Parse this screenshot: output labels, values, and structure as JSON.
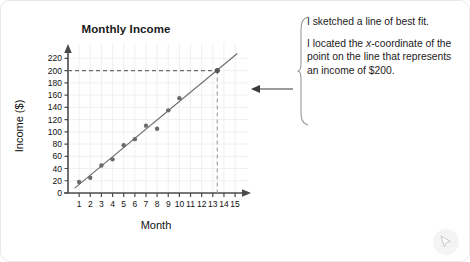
{
  "card": {
    "background": "#ffffff",
    "border_color": "#e8e8e8"
  },
  "chart_data": {
    "type": "scatter",
    "title": "Monthly Income",
    "xlabel": "Month",
    "ylabel": "Income ($)",
    "xlim": [
      0,
      15.8
    ],
    "ylim": [
      0,
      232
    ],
    "grid": true,
    "x_ticks": [
      1,
      2,
      3,
      4,
      5,
      6,
      7,
      8,
      9,
      10,
      11,
      12,
      13,
      14,
      15
    ],
    "y_ticks": [
      0,
      20,
      40,
      60,
      80,
      100,
      120,
      140,
      160,
      180,
      200,
      220
    ],
    "x_tick_labels": [
      "1",
      "2",
      "3",
      "4",
      "5",
      "6",
      "7",
      "8",
      "9",
      "10",
      "11",
      "12",
      "13",
      "14",
      "15"
    ],
    "y_tick_labels": [
      "0",
      "20",
      "40",
      "60",
      "80",
      "100",
      "120",
      "140",
      "160",
      "180",
      "200",
      "220"
    ],
    "x": [
      1,
      2,
      3,
      4,
      5,
      6,
      7,
      8,
      9,
      10
    ],
    "values": [
      18,
      25,
      45,
      55,
      78,
      88,
      110,
      105,
      135,
      155
    ],
    "point_color": "#6b6b6b",
    "series": [
      {
        "name": "Monthly income data",
        "points": [
          {
            "x": 1,
            "y": 18
          },
          {
            "x": 2,
            "y": 25
          },
          {
            "x": 3,
            "y": 45
          },
          {
            "x": 4,
            "y": 55
          },
          {
            "x": 5,
            "y": 78
          },
          {
            "x": 6,
            "y": 88
          },
          {
            "x": 7,
            "y": 110
          },
          {
            "x": 8,
            "y": 105
          },
          {
            "x": 9,
            "y": 135
          },
          {
            "x": 10,
            "y": 155
          }
        ]
      }
    ],
    "line_of_best_fit": {
      "name": "line of best fit",
      "from": {
        "x": 0.6,
        "y": 8
      },
      "to": {
        "x": 15.2,
        "y": 228
      },
      "color": "#6e6e6e"
    },
    "highlight_point": {
      "x": 13.4,
      "y": 200
    },
    "guide_lines": [
      {
        "name": "income-200-horizontal",
        "axis": "y",
        "value": 200,
        "style": "dashed"
      },
      {
        "name": "month-13.4-vertical",
        "axis": "x",
        "value": 13.4,
        "style": "dashed"
      }
    ],
    "grid_color": "#e4e7ee",
    "axis_color": "#555555"
  },
  "annotation": {
    "line1": "I sketched a line of best fit.",
    "line2_part1": "I located the ",
    "line2_italic": "x",
    "line2_part2": "-coordinate of the point on the line that represents an income of $200."
  },
  "icons": {
    "cursor": "cursor-pointer-icon",
    "callout_arrow": "left-arrow-icon",
    "brace": "curly-brace-icon"
  }
}
